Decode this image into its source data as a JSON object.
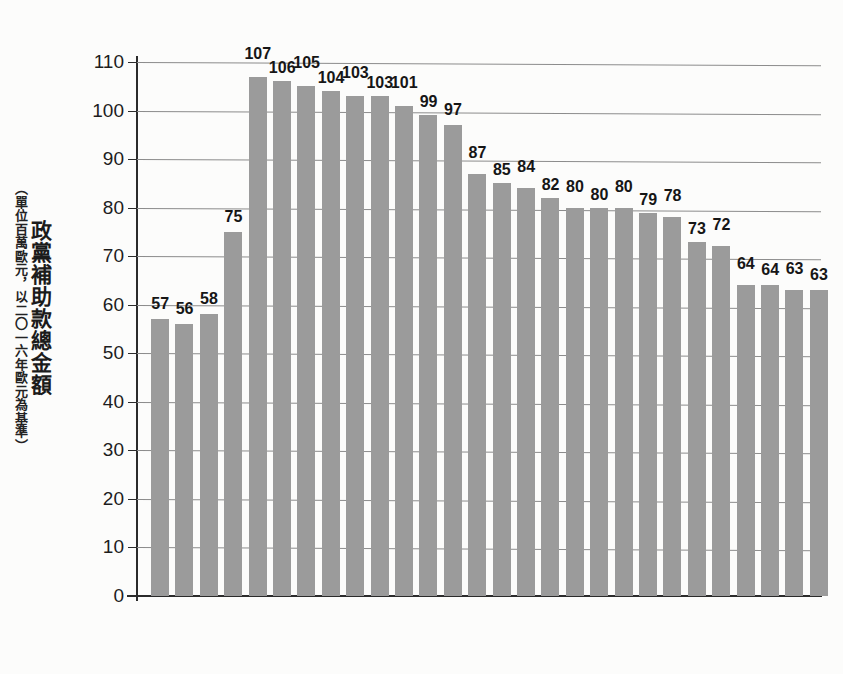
{
  "chart_data": {
    "type": "bar",
    "title": "政黨補助款總金額",
    "subtitle": "（單位百萬歐元，以二〇一六年歐元為基準）",
    "xlabel": "",
    "ylabel": "政黨補助款總金額",
    "ylim": [
      0,
      110
    ],
    "ytick_step": 10,
    "grid": true,
    "legend": "none",
    "bar_color": "#9b9b9b",
    "axis_color": "#2b2b2b",
    "grid_color": "#8c8c8c",
    "background_color": "#fcfcfb",
    "categories": [
      "1990",
      "1991",
      "1992",
      "1993",
      "1994",
      "1995",
      "1996",
      "1997",
      "1998",
      "1999",
      "2000",
      "2001",
      "2002",
      "2003",
      "2004",
      "2005",
      "2006",
      "2007",
      "2008",
      "2009",
      "2010",
      "2011",
      "2012",
      "2013",
      "2014",
      "2015",
      "2016",
      "2017"
    ],
    "values": [
      57,
      56,
      58,
      75,
      107,
      106,
      105,
      104,
      103,
      103,
      101,
      99,
      97,
      87,
      85,
      84,
      82,
      80,
      80,
      80,
      79,
      78,
      73,
      72,
      64,
      64,
      63,
      63
    ],
    "yticks": [
      "0",
      "10",
      "20",
      "30",
      "40",
      "50",
      "60",
      "70",
      "80",
      "90",
      "100",
      "110"
    ],
    "ytick_values": [
      0,
      10,
      20,
      30,
      40,
      50,
      60,
      70,
      80,
      90,
      100,
      110
    ]
  }
}
